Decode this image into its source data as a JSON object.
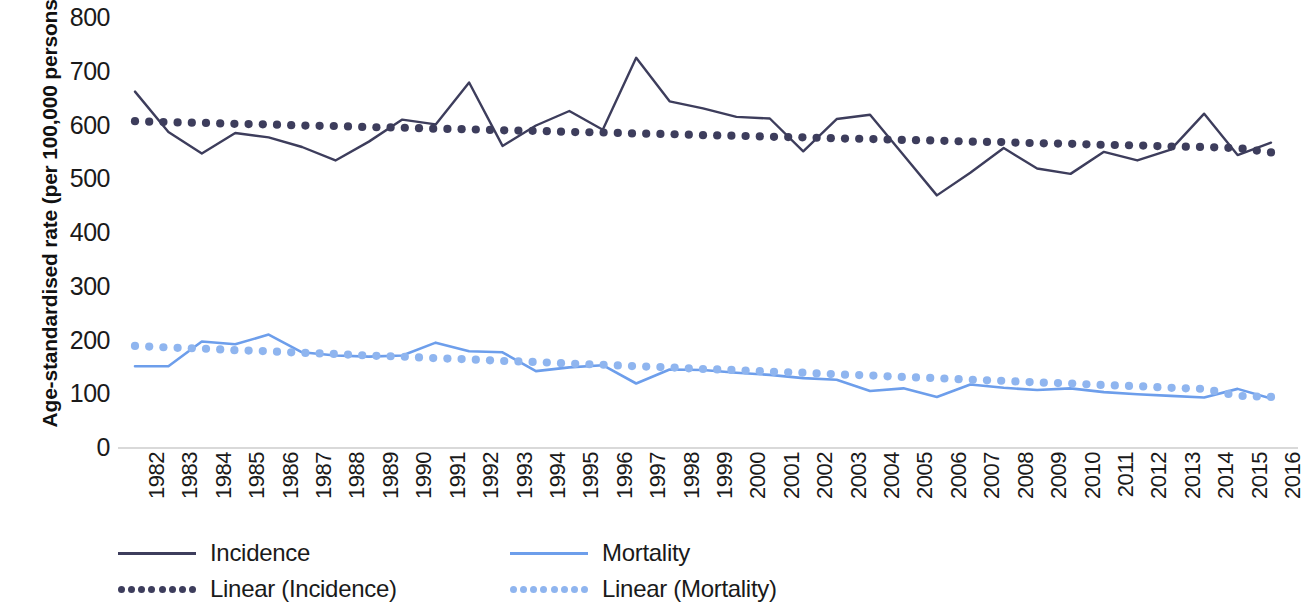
{
  "axes": {
    "y_title": "Age-standardised rate (per 100,000 persons)",
    "y_ticks": [
      "800",
      "700",
      "600",
      "500",
      "400",
      "300",
      "200",
      "100",
      "0"
    ]
  },
  "legend": {
    "items": [
      {
        "label": "Incidence",
        "style": "solid",
        "color": "#3d3d5c"
      },
      {
        "label": "Linear (Incidence)",
        "style": "dotted",
        "color": "#3d3d5c"
      },
      {
        "label": "Mortality",
        "style": "solid",
        "color": "#6d9eeb"
      },
      {
        "label": "Linear (Mortality)",
        "style": "dotted",
        "color": "#8fb5ef"
      }
    ]
  },
  "colors": {
    "incidence": "#3d3d5c",
    "incidence_trend": "#3d3d5c",
    "mortality": "#6d9eeb",
    "mortality_trend": "#8fb5ef",
    "axis": "#cccccc",
    "background": "#ffffff"
  },
  "chart_data": {
    "type": "line",
    "title": "",
    "xlabel": "",
    "ylabel": "Age-standardised rate (per 100,000 persons)",
    "ylim": [
      0,
      800
    ],
    "ytick_step": 100,
    "grid": false,
    "legend_position": "bottom-left",
    "categories": [
      "1982",
      "1983",
      "1984",
      "1985",
      "1986",
      "1987",
      "1988",
      "1989",
      "1990",
      "1991",
      "1992",
      "1993",
      "1994",
      "1995",
      "1996",
      "1997",
      "1998",
      "1999",
      "2000",
      "2001",
      "2002",
      "2003",
      "2004",
      "2005",
      "2006",
      "2007",
      "2008",
      "2009",
      "2010",
      "2011",
      "2012",
      "2013",
      "2014",
      "2015",
      "2016"
    ],
    "series": [
      {
        "name": "Incidence",
        "style": "solid",
        "color": "#3d3d5c",
        "values": [
          663,
          588,
          548,
          586,
          578,
          560,
          535,
          570,
          611,
          602,
          680,
          562,
          600,
          627,
          592,
          726,
          645,
          632,
          616,
          613,
          552,
          612,
          620,
          545,
          470,
          512,
          558,
          520,
          510,
          551,
          535,
          555,
          622,
          545,
          568
        ]
      },
      {
        "name": "Linear (Incidence)",
        "style": "dotted",
        "color": "#3d3d5c",
        "trendline_for": "Incidence",
        "values": [
          608,
          606,
          605,
          603,
          602,
          600,
          599,
          597,
          596,
          594,
          593,
          591,
          590,
          588,
          587,
          585,
          584,
          582,
          581,
          579,
          578,
          576,
          575,
          573,
          572,
          570,
          569,
          567,
          566,
          564,
          563,
          561,
          560,
          558,
          550
        ]
      },
      {
        "name": "Mortality",
        "style": "solid",
        "color": "#6d9eeb",
        "values": [
          152,
          152,
          198,
          193,
          211,
          178,
          172,
          170,
          172,
          196,
          180,
          178,
          143,
          150,
          154,
          120,
          146,
          145,
          140,
          136,
          130,
          127,
          106,
          111,
          95,
          118,
          112,
          108,
          111,
          104,
          100,
          97,
          94,
          110,
          92
        ]
      },
      {
        "name": "Linear (Mortality)",
        "style": "dotted",
        "color": "#8fb5ef",
        "trendline_for": "Mortality",
        "values": [
          190,
          187,
          185,
          182,
          180,
          177,
          175,
          172,
          170,
          167,
          165,
          162,
          160,
          157,
          155,
          152,
          150,
          147,
          145,
          142,
          140,
          137,
          135,
          132,
          130,
          127,
          125,
          122,
          120,
          117,
          115,
          112,
          110,
          97,
          95
        ]
      }
    ]
  }
}
